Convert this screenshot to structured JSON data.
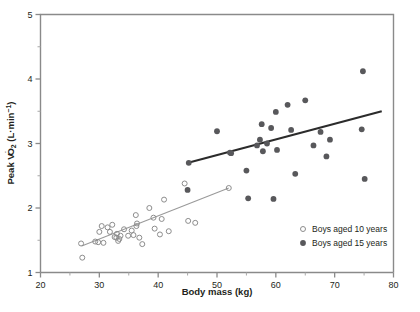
{
  "chart_data": {
    "type": "scatter",
    "title": "",
    "xlabel": "Body mass (kg)",
    "ylabel": "Peak VO2 (L·min⁻¹)",
    "ylabel_parts": {
      "prefix": "Peak V",
      "dotted": "V",
      "subscript": "O",
      "sub": "2",
      "units": " (L·min",
      "superscript": "−1",
      "suffix": ")"
    },
    "xlim": [
      20,
      80
    ],
    "ylim": [
      1,
      5
    ],
    "x_ticks": [
      20,
      30,
      40,
      50,
      60,
      70,
      80
    ],
    "x_minor_ticks": [
      25,
      35,
      45,
      55,
      65,
      75
    ],
    "y_ticks": [
      1,
      2,
      3,
      4,
      5
    ],
    "y_minor_ticks": [
      1.5,
      2.5,
      3.5,
      4.5
    ],
    "grid": false,
    "legend_position": "bottom-right",
    "series": [
      {
        "name": "Boys aged 10 years",
        "marker": "open-circle",
        "color": "#8d8d8d",
        "points": [
          [
            27.1,
            1.23
          ],
          [
            26.9,
            1.45
          ],
          [
            29.3,
            1.48
          ],
          [
            29.8,
            1.47
          ],
          [
            30.7,
            1.46
          ],
          [
            30.0,
            1.63
          ],
          [
            30.4,
            1.72
          ],
          [
            31.4,
            1.7
          ],
          [
            31.8,
            1.63
          ],
          [
            32.2,
            1.74
          ],
          [
            32.6,
            1.55
          ],
          [
            32.9,
            1.54
          ],
          [
            33.0,
            1.6
          ],
          [
            33.4,
            1.52
          ],
          [
            33.6,
            1.57
          ],
          [
            33.2,
            1.49
          ],
          [
            34.2,
            1.67
          ],
          [
            34.9,
            1.57
          ],
          [
            35.5,
            1.65
          ],
          [
            35.8,
            1.58
          ],
          [
            36.2,
            1.89
          ],
          [
            36.4,
            1.76
          ],
          [
            36.3,
            1.72
          ],
          [
            36.8,
            1.54
          ],
          [
            37.3,
            1.44
          ],
          [
            38.5,
            2.0
          ],
          [
            39.2,
            1.85
          ],
          [
            39.4,
            1.68
          ],
          [
            40.6,
            1.83
          ],
          [
            40.3,
            1.59
          ],
          [
            41.0,
            2.13
          ],
          [
            41.8,
            1.64
          ],
          [
            44.5,
            2.38
          ],
          [
            45.1,
            1.8
          ],
          [
            46.3,
            1.77
          ],
          [
            52.0,
            2.31
          ]
        ],
        "fit_line": {
          "x1": 27.0,
          "y1": 1.41,
          "x2": 52.0,
          "y2": 2.31
        }
      },
      {
        "name": "Boys aged 15 years",
        "marker": "filled-circle",
        "color": "#58585b",
        "points": [
          [
            45.2,
            2.7
          ],
          [
            45.0,
            2.28
          ],
          [
            50.0,
            3.19
          ],
          [
            52.2,
            2.86
          ],
          [
            52.4,
            2.85
          ],
          [
            55.0,
            2.58
          ],
          [
            55.3,
            2.15
          ],
          [
            56.8,
            2.97
          ],
          [
            57.3,
            3.06
          ],
          [
            57.6,
            3.3
          ],
          [
            57.8,
            2.88
          ],
          [
            58.5,
            3.0
          ],
          [
            59.2,
            3.24
          ],
          [
            60.0,
            3.49
          ],
          [
            60.2,
            2.9
          ],
          [
            59.6,
            2.14
          ],
          [
            62.0,
            3.6
          ],
          [
            62.6,
            3.21
          ],
          [
            63.3,
            2.53
          ],
          [
            65.0,
            3.67
          ],
          [
            66.4,
            2.97
          ],
          [
            67.6,
            3.18
          ],
          [
            68.6,
            2.8
          ],
          [
            69.2,
            3.06
          ],
          [
            74.8,
            4.12
          ],
          [
            74.6,
            3.22
          ],
          [
            75.1,
            2.45
          ]
        ],
        "fit_line": {
          "x1": 45.1,
          "y1": 2.7,
          "x2": 78.0,
          "y2": 3.5
        }
      }
    ]
  },
  "legend": {
    "items": [
      {
        "label": "Boys aged 10 years",
        "marker": "open-circle"
      },
      {
        "label": "Boys aged 15 years",
        "marker": "filled-circle"
      }
    ]
  },
  "axes": {
    "x_title": "Body mass (kg)",
    "x_tick_labels": [
      "20",
      "30",
      "40",
      "50",
      "60",
      "70",
      "80"
    ],
    "y_tick_labels": [
      "1",
      "2",
      "3",
      "4",
      "5"
    ]
  },
  "colors": {
    "axis": "#8a8a8a",
    "open_marker": "#8d8d8d",
    "filled_marker": "#58585b",
    "fit_10": "#9a9a9a",
    "fit_15": "#2b2b2b",
    "text": "#231f20",
    "background": "#ffffff"
  }
}
